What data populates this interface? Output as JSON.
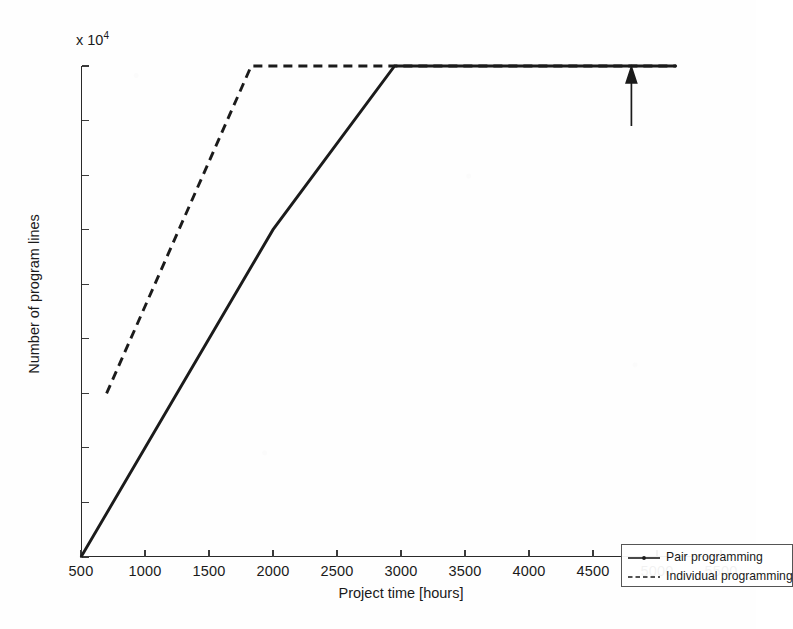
{
  "chart_data": {
    "type": "line",
    "title": "",
    "xlabel": "Project time [hours]",
    "ylabel": "Number of program lines",
    "y_exponent_label": "x 10",
    "y_exponent_power": "4",
    "xlim": [
      500,
      5500
    ],
    "ylim": [
      6000,
      24000
    ],
    "xticks": [
      500,
      1000,
      1500,
      2000,
      2500,
      3000,
      3500,
      4000,
      4500,
      5000,
      5500
    ],
    "xticklabels": [
      "500",
      "1000",
      "1500",
      "2000",
      "2500",
      "3000",
      "3500",
      "4000",
      "4500",
      "5000",
      "5500"
    ],
    "yticks": [
      6000,
      8000,
      10000,
      12000,
      14000,
      16000,
      18000,
      20000,
      22000,
      24000
    ],
    "yticklabels": [
      "0.6",
      "0.8",
      "1",
      "1.2",
      "1.4",
      "1.6",
      "1.8",
      "2",
      "2.2",
      "2.4"
    ],
    "grid": false,
    "legend_position": "lower right",
    "series": [
      {
        "name": "Pair programming",
        "style": "solid",
        "color": "#1b1b1b",
        "marker": "dot",
        "x": [
          500,
          1250,
          2000,
          2950,
          5150
        ],
        "y": [
          6000,
          12000,
          18000,
          24000,
          24000
        ]
      },
      {
        "name": "Individual programming",
        "style": "dashed",
        "color": "#1b1b1b",
        "marker": "none",
        "x": [
          700,
          1830,
          5150
        ],
        "y": [
          12000,
          24000,
          24000
        ]
      }
    ],
    "annotations": [
      {
        "type": "arrow",
        "direction": "up",
        "x": 4800,
        "y_tail": 21800,
        "y_head": 24000,
        "label": ""
      }
    ]
  },
  "legend": {
    "items": [
      {
        "label": "Pair programming",
        "style": "solid"
      },
      {
        "label": "Individual programming",
        "style": "dashed"
      }
    ]
  }
}
